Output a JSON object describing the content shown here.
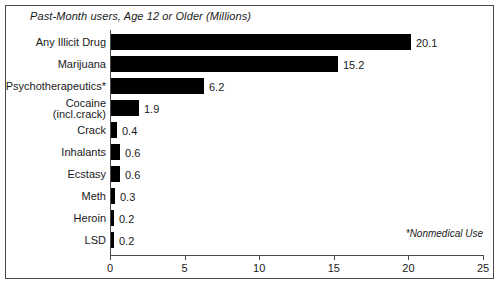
{
  "chart_data": {
    "type": "bar",
    "orientation": "horizontal",
    "title": "Past-Month users, Age 12 or Older (Millions)",
    "xlabel": "",
    "ylabel": "",
    "xlim": [
      0,
      25
    ],
    "xticks": [
      0,
      5,
      10,
      15,
      20,
      25
    ],
    "xtick_labels": [
      "0",
      "5",
      "10",
      "15",
      "20",
      "25"
    ],
    "grid": false,
    "legend": null,
    "annotations": [
      "*Nonmedical Use"
    ],
    "categories": [
      "Any Illicit Drug",
      "Marijuana",
      "Psychotherapeutics*",
      "Cocaine (incl.crack)",
      "Crack",
      "Inhalants",
      "Ecstasy",
      "Meth",
      "Heroin",
      "LSD"
    ],
    "values": [
      20.1,
      15.2,
      6.2,
      1.9,
      0.4,
      0.6,
      0.6,
      0.3,
      0.2,
      0.2
    ],
    "value_labels": [
      "20.1",
      "15.2",
      "6.2",
      "1.9",
      "0.4",
      "0.6",
      "0.6",
      "0.3",
      "0.2",
      "0.2"
    ],
    "bar_color": "#000000",
    "axis_color": "#4a4a4a",
    "background": "#ffffff"
  },
  "chart": {
    "title": "Past-Month users, Age 12 or Older (Millions)",
    "footnote": "*Nonmedical Use",
    "rows": [
      {
        "label": "Any Illicit Drug",
        "label2": "",
        "value": "20.1"
      },
      {
        "label": "Marijuana",
        "label2": "",
        "value": "15.2"
      },
      {
        "label": "Psychotherapeutics*",
        "label2": "",
        "value": "6.2"
      },
      {
        "label": "Cocaine",
        "label2": "(incl.crack)",
        "value": "1.9"
      },
      {
        "label": "Crack",
        "label2": "",
        "value": "0.4"
      },
      {
        "label": "Inhalants",
        "label2": "",
        "value": "0.6"
      },
      {
        "label": "Ecstasy",
        "label2": "",
        "value": "0.6"
      },
      {
        "label": "Meth",
        "label2": "",
        "value": "0.3"
      },
      {
        "label": "Heroin",
        "label2": "",
        "value": "0.2"
      },
      {
        "label": "LSD",
        "label2": "",
        "value": "0.2"
      }
    ],
    "axis": {
      "ticks": [
        "0",
        "5",
        "10",
        "15",
        "20",
        "25"
      ]
    }
  }
}
